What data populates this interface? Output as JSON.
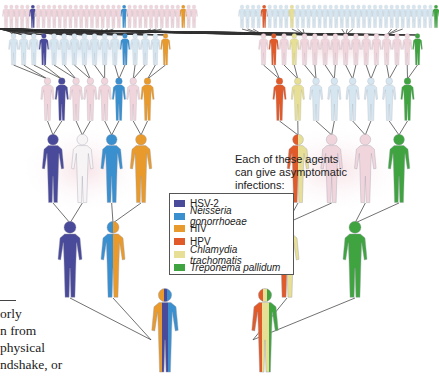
{
  "caption": {
    "line1": "Each of these agents",
    "line2": "can give asymptomatic",
    "line3": "infections:"
  },
  "legend": {
    "items": [
      {
        "label": "HSV-2",
        "color": "#4a4a9a",
        "italic": false
      },
      {
        "label": "Neisseria gonorrhoeae",
        "color": "#3a8fcf",
        "italic": true
      },
      {
        "label": "HIV",
        "color": "#e89a2c",
        "italic": false
      },
      {
        "label": "HPV",
        "color": "#e05a2a",
        "italic": false
      },
      {
        "label": "Chlamydia trachomatis",
        "color": "#e6df95",
        "italic": true
      },
      {
        "label": "Treponema pallidum",
        "color": "#3fa43f",
        "italic": false
      }
    ]
  },
  "side_text": {
    "lines": [
      "orly",
      "n from",
      "physical",
      "ndshake, or"
    ]
  },
  "colors": {
    "hsv2": "#4a4a9a",
    "neisseria": "#3a8fcf",
    "hiv": "#e89a2c",
    "hpv": "#e05a2a",
    "chlamydia": "#e6df95",
    "treponema": "#3fa43f",
    "uninfected_pink": "#f0d6dc",
    "uninfected_blue": "#d6e6f0",
    "connector": "#333333"
  },
  "diagram": {
    "left_tree": {
      "row1": {
        "count": 36,
        "base": "pink",
        "infected": {
          "5": "hsv2",
          "22": "neisseria",
          "33": "hiv"
        }
      },
      "row2": {
        "count": 16,
        "base": "blue",
        "infected": {
          "3": "hsv2",
          "11": "neisseria",
          "15": "hiv"
        }
      },
      "row3": {
        "count": 8,
        "base": "pink",
        "infected": {
          "1": "hsv2",
          "5": "neisseria",
          "7": "hiv"
        }
      },
      "row4": {
        "count": 4,
        "infected": [
          "hsv2",
          "white",
          "neisseria",
          "hiv"
        ]
      },
      "row5": {
        "count": 2,
        "infected": [
          [
            "hsv2"
          ],
          [
            "neisseria",
            "hiv"
          ]
        ]
      },
      "row6": {
        "count": 1,
        "infected": [
          [
            "hiv",
            "hsv2",
            "neisseria"
          ]
        ]
      }
    },
    "right_tree": {
      "row1": {
        "count": 36,
        "base": "blue",
        "infected": {
          "4": "hpv",
          "9": "chlamydia",
          "35": "treponema"
        }
      },
      "row2": {
        "count": 16,
        "base": "pink",
        "infected": {
          "1": "hpv",
          "3": "chlamydia",
          "15": "treponema"
        }
      },
      "row3": {
        "count": 8,
        "base": "blue",
        "infected": {
          "0": "hpv",
          "1": "chlamydia",
          "7": "treponema"
        }
      },
      "row4": {
        "count": 4,
        "infected": [
          [
            "hpv",
            "chlamydia"
          ],
          "pink",
          "pink",
          "treponema"
        ]
      },
      "row5": {
        "count": 2,
        "infected": [
          [
            "hpv",
            "chlamydia"
          ],
          [
            "treponema"
          ]
        ]
      },
      "row6": {
        "count": 1,
        "infected": [
          [
            "hpv",
            "chlamydia",
            "treponema"
          ]
        ]
      }
    }
  }
}
